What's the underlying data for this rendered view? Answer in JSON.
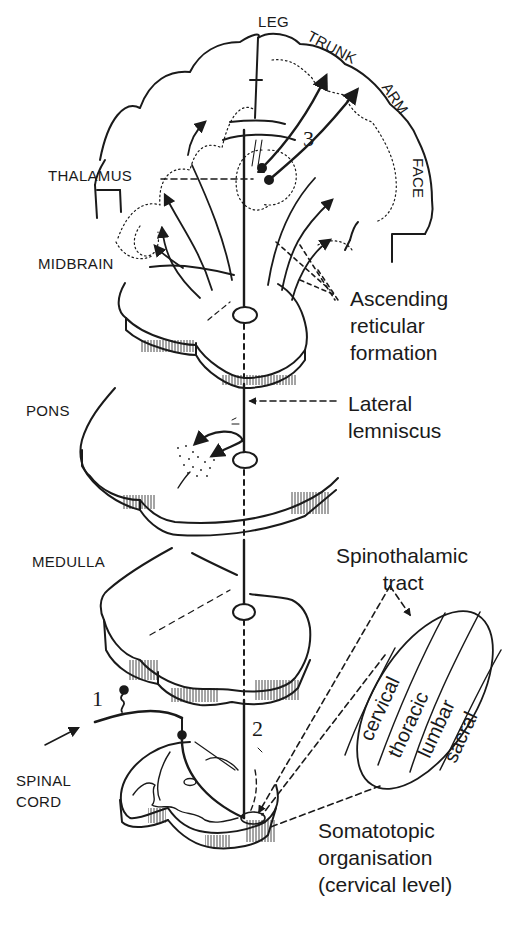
{
  "figure": {
    "type": "anatomical line drawing"
  },
  "cortex_labels": {
    "leg": "LEG",
    "trunk": "TRUNK",
    "arm": "ARM",
    "face": "FACE"
  },
  "level_labels": {
    "thalamus": "THALAMUS",
    "midbrain": "MIDBRAIN",
    "pons": "PONS",
    "medulla": "MEDULLA",
    "spinal_cord": "SPINAL\nCORD"
  },
  "callouts": {
    "ascending_reticular": "Ascending\nreticular\nformation",
    "lateral_lemniscus": "Lateral\nlemniscus",
    "spinothalamic_tract": "Spinothalamic\n        tract",
    "somatotopic": "Somatotopic\norganisation\n(cervical level)"
  },
  "neuron_numbers": {
    "first": "1",
    "second": "2",
    "third": "3"
  },
  "somatotopic_segments": [
    "cervical",
    "thoracic",
    "lumbar",
    "sacral"
  ],
  "colors": {
    "ink": "#1a1a1a",
    "background": "#ffffff"
  }
}
